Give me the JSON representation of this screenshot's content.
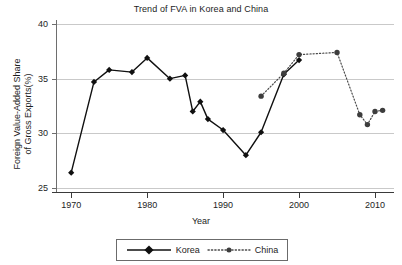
{
  "chart_data": {
    "type": "line",
    "title": "Trend of FVA in Korea and China",
    "xlabel": "Year",
    "ylabel": "Foreign Value-Added Share of Gross Exports(%)",
    "ylabel_line1": "Foreign Value-Added Share",
    "ylabel_line2": "of Gross Exports(%)",
    "xlim": [
      1968,
      2012.5
    ],
    "ylim": [
      25,
      40
    ],
    "xticks": [
      1970,
      1980,
      1990,
      2000,
      2010
    ],
    "yticks": [
      25,
      30,
      35,
      40
    ],
    "xtick_labels": [
      "1970",
      "1980",
      "1990",
      "2000",
      "2010"
    ],
    "ytick_labels": [
      "25",
      "30",
      "35",
      "40"
    ],
    "grid": "horizontal",
    "legend_position": "below-axis-centered",
    "series": [
      {
        "name": "Korea",
        "color": "#101010",
        "linestyle": "solid",
        "marker": "diamond",
        "x": [
          1970,
          1973,
          1975,
          1978,
          1980,
          1983,
          1985,
          1986,
          1987,
          1988,
          1990,
          1993,
          1995,
          1998,
          2000
        ],
        "values": [
          26.4,
          34.7,
          35.8,
          35.6,
          36.9,
          35.0,
          35.3,
          32.0,
          32.9,
          31.3,
          30.3,
          28.0,
          30.1,
          35.4,
          36.7
        ]
      },
      {
        "name": "China",
        "color": "#4a4a4a",
        "linestyle": "dotted",
        "marker": "circle",
        "x": [
          1995,
          1998,
          2000,
          2005,
          2008,
          2009,
          2010,
          2011
        ],
        "values": [
          33.4,
          35.5,
          37.2,
          37.4,
          31.7,
          30.8,
          32.0,
          32.1
        ]
      }
    ]
  },
  "legend": {
    "items": [
      {
        "label": "Korea",
        "color": "#101010",
        "linestyle": "solid",
        "marker": "diamond"
      },
      {
        "label": "China",
        "color": "#4a4a4a",
        "linestyle": "dotted",
        "marker": "circle"
      }
    ]
  }
}
